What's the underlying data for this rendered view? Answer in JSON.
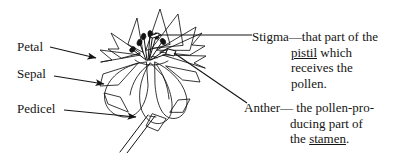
{
  "figure": {
    "type": "botanical-diagram",
    "background_color": "#ffffff",
    "ink_color": "#141414"
  },
  "labels_left": [
    {
      "name": "petal",
      "text": "Petal",
      "arrow": true
    },
    {
      "name": "sepal",
      "text": "Sepal",
      "arrow": true
    },
    {
      "name": "pedicel",
      "text": "Pedicel",
      "arrow": true
    }
  ],
  "definitions": [
    {
      "name": "stigma",
      "term": "Stigma",
      "dash": "—",
      "head_rest": "that part of the",
      "lines": [
        {
          "pre": "",
          "underlined": "pistil",
          "post": " which"
        },
        {
          "pre": "receives the",
          "underlined": "",
          "post": ""
        },
        {
          "pre": "pollen.",
          "underlined": "",
          "post": ""
        }
      ]
    },
    {
      "name": "anther",
      "term": "Anther",
      "dash": "—",
      "head_rest": " the pollen-pro-",
      "lines": [
        {
          "pre": "ducing part of",
          "underlined": "",
          "post": ""
        },
        {
          "pre": "the ",
          "underlined": "stamen",
          "post": "."
        }
      ]
    }
  ],
  "artwork_alt": "Line drawing of an open flower viewed from the side, showing layered petals, sepals beneath, a central cluster of stamens with anthers and a pistil, and a long pedicel stem angling down to the lower left."
}
